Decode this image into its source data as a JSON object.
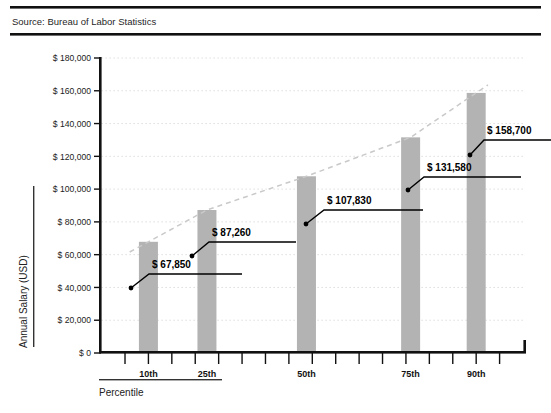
{
  "header": {
    "source_note": "Source: Bureau of Labor Statistics"
  },
  "footer": {
    "axis_caption": "Percentile"
  },
  "chart_data": {
    "type": "bar",
    "title": "",
    "subtitle": "",
    "xlabel": "Percentile",
    "ylabel": "Annual Salary (USD)",
    "categories": [
      "10th",
      "25th",
      "50th",
      "75th",
      "90th"
    ],
    "values": [
      67850,
      107830,
      131580,
      158700,
      87260
    ],
    "series": [
      {
        "name": "Annual Salary (USD)",
        "values": [
          67850,
          87260,
          107830,
          131580,
          158700
        ]
      }
    ],
    "data_labels": [
      "$ 67,850",
      "$ 87,260",
      "$ 107,830",
      "$ 131,580",
      "$ 158,700"
    ],
    "ylim": [
      0,
      180000
    ],
    "ytick_values": [
      0,
      20000,
      40000,
      60000,
      80000,
      100000,
      120000,
      140000,
      160000,
      180000
    ],
    "ytick_labels": [
      "$ 0",
      "$ 20,000",
      "$ 40,000",
      "$ 60,000",
      "$ 80,000",
      "$ 100,000",
      "$ 120,000",
      "$ 140,000",
      "$ 160,000",
      "$ 180,000"
    ],
    "xtick_labels": [
      "10th",
      "25th",
      "50th",
      "75th",
      "90th"
    ],
    "grid": "horizontal-dotted",
    "legend": "none",
    "trendline": {
      "type": "dashed",
      "label": "",
      "color": "#c9c9c9"
    },
    "colors": {
      "bar_fill": "#b3b3b3",
      "axis": "#111111",
      "grid": "#cccccc",
      "callout": "#000000",
      "rule": "#111111"
    },
    "annotations": [
      {
        "label": "$ 67,850",
        "category": "10th",
        "value": 67850
      },
      {
        "label": "$ 87,260",
        "category": "25th",
        "value": 87260
      },
      {
        "label": "$ 107,830",
        "category": "50th",
        "value": 107830
      },
      {
        "label": "$ 131,580",
        "category": "75th",
        "value": 131580
      },
      {
        "label": "$ 158,700",
        "category": "90th",
        "value": 158700
      }
    ]
  }
}
